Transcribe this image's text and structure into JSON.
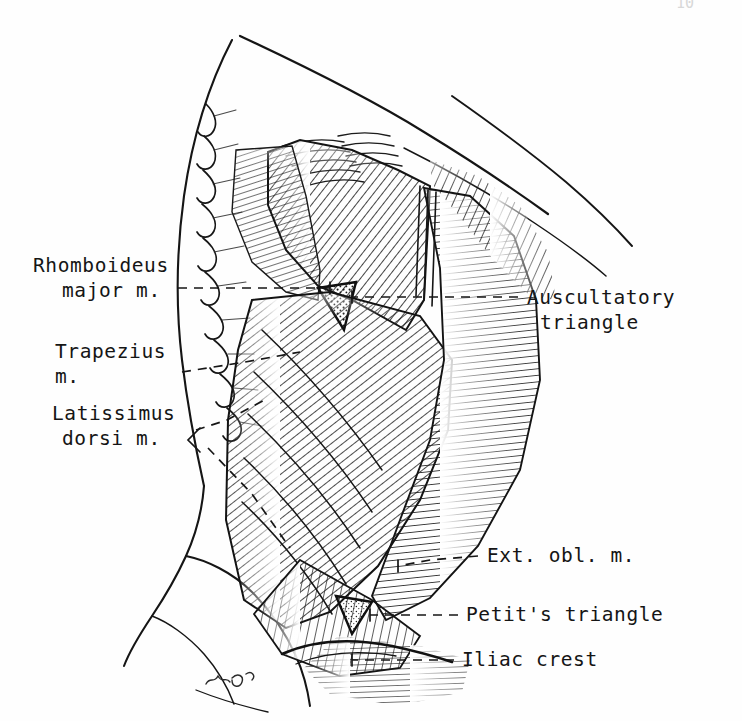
{
  "plate": {
    "title": "Posterior trunk musculature",
    "medium": "pen-and-ink line engraving",
    "background_color": "#fefefe",
    "ink_color": "#151515",
    "folio_number": "10",
    "signature": "artist monogram"
  },
  "labels": [
    {
      "id": "rhomboideus-major",
      "lines": [
        "Rhomboideus",
        "major m."
      ],
      "side": "left",
      "text_x": 33,
      "text_y": 272,
      "line_height": 25,
      "leader": [
        [
          178,
          288
        ],
        [
          215,
          288
        ],
        [
          330,
          288
        ]
      ],
      "leader_style": "dashed"
    },
    {
      "id": "trapezius",
      "lines": [
        "Trapezius",
        "m."
      ],
      "side": "left",
      "text_x": 55,
      "text_y": 358,
      "line_height": 25,
      "leader": [
        [
          182,
          372
        ],
        [
          245,
          362
        ],
        [
          300,
          352
        ]
      ],
      "leader_style": "dashed"
    },
    {
      "id": "latissimus-dorsi",
      "lines": [
        "Latissimus",
        "dorsi m."
      ],
      "side": "left",
      "text_x": 52,
      "text_y": 420,
      "line_height": 25,
      "leader": [
        [
          196,
          430
        ],
        [
          227,
          420
        ],
        [
          268,
          398
        ]
      ],
      "leader_style": "dashed",
      "bracket": [
        [
          196,
          430
        ],
        [
          208,
          440
        ],
        [
          196,
          452
        ]
      ],
      "leader2": [
        [
          208,
          445
        ],
        [
          250,
          490
        ],
        [
          288,
          545
        ]
      ]
    },
    {
      "id": "auscultatory-triangle",
      "lines": [
        "Auscultatory",
        "triangle"
      ],
      "side": "right",
      "text_x": 527,
      "text_y": 304,
      "line_height": 25,
      "leader": [
        [
          518,
          297
        ],
        [
          460,
          297
        ],
        [
          352,
          297
        ]
      ],
      "leader_style": "dashed"
    },
    {
      "id": "ext-obl-m",
      "lines": [
        "Ext. obl. m."
      ],
      "side": "right",
      "text_x": 487,
      "text_y": 562,
      "line_height": 25,
      "leader": [
        [
          478,
          556
        ],
        [
          430,
          560
        ],
        [
          398,
          566
        ]
      ],
      "leader_style": "dashed"
    },
    {
      "id": "petits-triangle",
      "lines": [
        "Petit's triangle"
      ],
      "side": "right",
      "text_x": 466,
      "text_y": 621,
      "line_height": 25,
      "leader": [
        [
          458,
          615
        ],
        [
          420,
          615
        ],
        [
          370,
          615
        ]
      ],
      "leader_style": "dashed"
    },
    {
      "id": "iliac-crest",
      "lines": [
        "Iliac crest"
      ],
      "side": "right",
      "text_x": 462,
      "text_y": 666,
      "line_height": 25,
      "leader": [
        [
          454,
          660
        ],
        [
          410,
          660
        ],
        [
          352,
          660
        ]
      ],
      "leader_style": "dashed"
    }
  ],
  "regions": [
    {
      "id": "trapezius-sheet",
      "description": "upper hatched trapezius fibers"
    },
    {
      "id": "rhomboid-sheet",
      "description": "rhomboideus major oblique fibers"
    },
    {
      "id": "auscultatory-triangle-patch",
      "description": "stippled triangle of auscultation"
    },
    {
      "id": "latissimus-sheet",
      "description": "broad latissimus dorsi fan"
    },
    {
      "id": "external-oblique-sheet",
      "description": "vertical external oblique fibers"
    },
    {
      "id": "petits-triangle-patch",
      "description": "small stippled lumbar triangle"
    },
    {
      "id": "iliac-crest-line",
      "description": "iliac crest border"
    },
    {
      "id": "vertebral-spines",
      "description": "row of spinous processes"
    },
    {
      "id": "scapula-border",
      "description": "medial scapular border"
    },
    {
      "id": "body-contour",
      "description": "outer torso and hip outline"
    }
  ]
}
